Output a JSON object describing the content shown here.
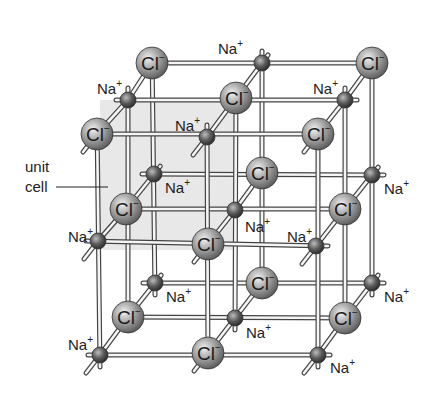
{
  "diagram": {
    "colors": {
      "background": "#ffffff",
      "unit_cell_fill": "#e6e6e6",
      "rod_fill": "#f5f5f5",
      "rod_stroke": "#444444",
      "cl_ion": "#8a8a8a",
      "na_ion": "#4a4a4a"
    },
    "grid": {
      "front_origin": [
        97,
        133
      ],
      "col_step": 110,
      "row_step": 110,
      "depth_step": [
        27,
        -35
      ]
    },
    "unit_cell_label": {
      "line1": "unit",
      "line2": "cell"
    },
    "ion_labels": {
      "cl": "Cl",
      "cl_charge": "−",
      "na": "Na",
      "na_charge": "+"
    },
    "nodes": [
      {
        "layer": "back",
        "x": 152,
        "y": 63,
        "ion": "Cl"
      },
      {
        "layer": "back",
        "x": 262,
        "y": 63,
        "ion": "Na",
        "label_pos": [
          218,
          54
        ]
      },
      {
        "layer": "back",
        "x": 372,
        "y": 63,
        "ion": "Cl"
      },
      {
        "layer": "back",
        "x": 154,
        "y": 174,
        "ion": "Na",
        "label_pos": [
          165,
          193
        ]
      },
      {
        "layer": "back",
        "x": 262,
        "y": 173,
        "ion": "Cl"
      },
      {
        "layer": "back",
        "x": 372,
        "y": 175,
        "ion": "Na",
        "label_pos": [
          384,
          194
        ]
      },
      {
        "layer": "back",
        "x": 155,
        "y": 283,
        "ion": "Na",
        "label_pos": [
          166,
          302
        ]
      },
      {
        "layer": "back",
        "x": 262,
        "y": 283,
        "ion": "Cl"
      },
      {
        "layer": "back",
        "x": 372,
        "y": 283,
        "ion": "Na",
        "label_pos": [
          384,
          302
        ]
      },
      {
        "layer": "middle",
        "x": 128,
        "y": 100,
        "ion": "Na",
        "label_pos": [
          97,
          94
        ]
      },
      {
        "layer": "middle",
        "x": 236,
        "y": 98,
        "ion": "Cl"
      },
      {
        "layer": "middle",
        "x": 345,
        "y": 100,
        "ion": "Na",
        "label_pos": [
          313,
          94
        ]
      },
      {
        "layer": "middle",
        "x": 126,
        "y": 209,
        "ion": "Cl"
      },
      {
        "layer": "middle",
        "x": 235,
        "y": 210,
        "ion": "Na",
        "label_pos": [
          245,
          232
        ]
      },
      {
        "layer": "middle",
        "x": 345,
        "y": 209,
        "ion": "Cl"
      },
      {
        "layer": "middle",
        "x": 128,
        "y": 317,
        "ion": "Cl"
      },
      {
        "layer": "middle",
        "x": 235,
        "y": 318,
        "ion": "Na",
        "label_pos": [
          246,
          338
        ]
      },
      {
        "layer": "middle",
        "x": 345,
        "y": 318,
        "ion": "Cl"
      },
      {
        "layer": "front",
        "x": 97,
        "y": 134,
        "ion": "Cl"
      },
      {
        "layer": "front",
        "x": 207,
        "y": 137,
        "ion": "Na",
        "label_pos": [
          175,
          131
        ]
      },
      {
        "layer": "front",
        "x": 318,
        "y": 134,
        "ion": "Cl"
      },
      {
        "layer": "front",
        "x": 98,
        "y": 241,
        "ion": "Na",
        "label_pos": [
          68,
          242
        ]
      },
      {
        "layer": "front",
        "x": 208,
        "y": 244,
        "ion": "Cl"
      },
      {
        "layer": "front",
        "x": 316,
        "y": 246,
        "ion": "Na",
        "label_pos": [
          287,
          242
        ]
      },
      {
        "layer": "front",
        "x": 100,
        "y": 355,
        "ion": "Na",
        "label_pos": [
          68,
          350
        ]
      },
      {
        "layer": "front",
        "x": 208,
        "y": 353,
        "ion": "Cl"
      },
      {
        "layer": "front",
        "x": 318,
        "y": 355,
        "ion": "Na",
        "label_pos": [
          330,
          373
        ]
      }
    ]
  }
}
